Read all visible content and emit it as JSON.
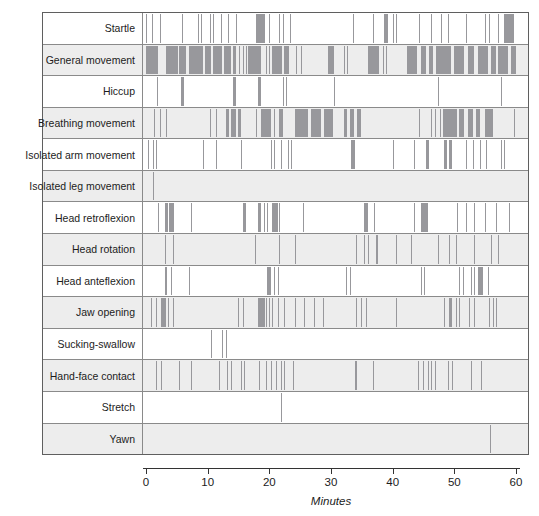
{
  "chart_data": {
    "type": "scatter",
    "subtype": "event-raster-timeline",
    "title": "",
    "xlabel": "Minutes",
    "xlim": [
      0,
      60
    ],
    "xticks": [
      0,
      10,
      20,
      30,
      40,
      50,
      60
    ],
    "grid": false,
    "legend": "none",
    "event_format": "[start_minute, duration_minutes]",
    "categories": [
      "Startle",
      "General movement",
      "Hiccup",
      "Breathing movement",
      "Isolated arm movement",
      "Isolated leg movement",
      "Head retroflexion",
      "Head rotation",
      "Head anteflexion",
      "Jaw opening",
      "Sucking-swallow",
      "Hand-face contact",
      "Stretch",
      "Yawn"
    ],
    "rows": [
      {
        "label": "Startle",
        "events": [
          [
            0,
            0.2
          ],
          [
            1,
            0.2
          ],
          [
            2.3,
            0.2
          ],
          [
            5.8,
            0.2
          ],
          [
            8.5,
            0.2
          ],
          [
            8.9,
            0.2
          ],
          [
            10.3,
            0.2
          ],
          [
            10.8,
            0.2
          ],
          [
            12.2,
            0.2
          ],
          [
            13.3,
            0.2
          ],
          [
            14.6,
            0.2
          ],
          [
            17.8,
            1.4
          ],
          [
            20,
            0.2
          ],
          [
            21.6,
            0.2
          ],
          [
            22.2,
            0.2
          ],
          [
            23.4,
            0.2
          ],
          [
            33.5,
            0.2
          ],
          [
            36.8,
            0.2
          ],
          [
            38.6,
            0.7
          ],
          [
            40,
            0.2
          ],
          [
            40.5,
            0.2
          ],
          [
            44.3,
            0.2
          ],
          [
            46.2,
            0.2
          ],
          [
            47.8,
            0.2
          ],
          [
            48.9,
            0.2
          ],
          [
            51.9,
            0.2
          ],
          [
            54.9,
            0.2
          ],
          [
            55.7,
            0.2
          ],
          [
            57,
            0.2
          ],
          [
            58.1,
            1.6
          ]
        ]
      },
      {
        "label": "General movement",
        "events": [
          [
            0,
            1.9
          ],
          [
            3.2,
            1.9
          ],
          [
            5.4,
            1.1
          ],
          [
            7,
            2.2
          ],
          [
            9.5,
            1
          ],
          [
            10.8,
            1.4
          ],
          [
            12.7,
            1.1
          ],
          [
            14.1,
            0.5
          ],
          [
            15.1,
            0.2
          ],
          [
            15.7,
            0.2
          ],
          [
            16.2,
            0.2
          ],
          [
            16.5,
            2.1
          ],
          [
            19.5,
            0.2
          ],
          [
            20,
            0.2
          ],
          [
            20.5,
            1.7
          ],
          [
            22.4,
            0.8
          ],
          [
            24.3,
            0.2
          ],
          [
            25.1,
            0.2
          ],
          [
            29.5,
            1
          ],
          [
            32.1,
            0.2
          ],
          [
            32.6,
            0.2
          ],
          [
            36,
            1.8
          ],
          [
            38.4,
            0.2
          ],
          [
            38.9,
            0.2
          ],
          [
            42.4,
            1.7
          ],
          [
            44.6,
            0.8
          ],
          [
            45.9,
            0.6
          ],
          [
            47,
            2.5
          ],
          [
            50,
            1.6
          ],
          [
            52.2,
            1
          ],
          [
            53.8,
            1.6
          ],
          [
            56,
            0.8
          ],
          [
            57,
            1.6
          ],
          [
            59.2,
            0.8
          ]
        ]
      },
      {
        "label": "Hiccup",
        "events": [
          [
            1.8,
            0.2
          ],
          [
            5.7,
            0.5
          ],
          [
            14.1,
            0.5
          ],
          [
            18.1,
            0.5
          ],
          [
            22.2,
            0.2
          ],
          [
            22.7,
            0.2
          ],
          [
            30.5,
            0.2
          ],
          [
            47.3,
            0.2
          ],
          [
            57.6,
            0.2
          ]
        ]
      },
      {
        "label": "Breathing movement",
        "events": [
          [
            1.3,
            0.2
          ],
          [
            2.2,
            0.2
          ],
          [
            3.2,
            0.2
          ],
          [
            10.3,
            0.2
          ],
          [
            11.4,
            0.2
          ],
          [
            13,
            0.5
          ],
          [
            13.8,
            0.8
          ],
          [
            14.9,
            0.5
          ],
          [
            17.8,
            0.2
          ],
          [
            18.6,
            1.7
          ],
          [
            20.8,
            0.2
          ],
          [
            21.6,
            0.6
          ],
          [
            24.1,
            2.1
          ],
          [
            26.8,
            1.6
          ],
          [
            28.9,
            1.4
          ],
          [
            32.1,
            0.5
          ],
          [
            33.1,
            0.6
          ],
          [
            34.2,
            0.6
          ],
          [
            44.3,
            0.2
          ],
          [
            46.2,
            0.2
          ],
          [
            46.8,
            0.2
          ],
          [
            47.6,
            0.2
          ],
          [
            48.1,
            2.2
          ],
          [
            50.8,
            0.8
          ],
          [
            52.2,
            0.8
          ],
          [
            53.5,
            0.6
          ],
          [
            54.9,
            1.3
          ],
          [
            59.7,
            0.2
          ]
        ]
      },
      {
        "label": "Isolated arm movement",
        "events": [
          [
            0.3,
            0.2
          ],
          [
            1.1,
            0.2
          ],
          [
            1.6,
            0.2
          ],
          [
            9.2,
            0.2
          ],
          [
            11.4,
            0.2
          ],
          [
            15.4,
            0.2
          ],
          [
            20.3,
            0.2
          ],
          [
            20.8,
            0.2
          ],
          [
            21.9,
            0.2
          ],
          [
            23,
            0.2
          ],
          [
            23.5,
            0.2
          ],
          [
            33.2,
            0.6
          ],
          [
            40,
            0.2
          ],
          [
            43.5,
            0.2
          ],
          [
            45.4,
            0.5
          ],
          [
            48.4,
            0.5
          ],
          [
            49.2,
            0.5
          ],
          [
            51.9,
            0.2
          ],
          [
            53,
            0.2
          ],
          [
            54.1,
            0.2
          ],
          [
            55.1,
            0.2
          ],
          [
            57.6,
            0.2
          ],
          [
            58.1,
            0.2
          ]
        ]
      },
      {
        "label": "Isolated leg movement",
        "events": [
          [
            1.2,
            0.2
          ]
        ]
      },
      {
        "label": "Head retroflexion",
        "events": [
          [
            1.9,
            0.2
          ],
          [
            3,
            0.5
          ],
          [
            3.8,
            0.8
          ],
          [
            7.3,
            0.2
          ],
          [
            15.7,
            0.5
          ],
          [
            18.1,
            0.5
          ],
          [
            19.2,
            0.2
          ],
          [
            19.7,
            0.2
          ],
          [
            20.5,
            0.9
          ],
          [
            21.6,
            0.2
          ],
          [
            25.4,
            0.2
          ],
          [
            35.4,
            0.6
          ],
          [
            37,
            0.2
          ],
          [
            43.5,
            0.2
          ],
          [
            44.6,
            1.1
          ],
          [
            50.5,
            0.2
          ],
          [
            51.9,
            0.2
          ],
          [
            53.2,
            0.2
          ],
          [
            54.9,
            0.2
          ],
          [
            56.8,
            0.2
          ],
          [
            58.9,
            0.2
          ]
        ]
      },
      {
        "label": "Head rotation",
        "events": [
          [
            3,
            0.2
          ],
          [
            4.3,
            0.2
          ],
          [
            17.6,
            0.2
          ],
          [
            21.6,
            0.2
          ],
          [
            24.1,
            0.2
          ],
          [
            34.1,
            0.2
          ],
          [
            35.4,
            0.2
          ],
          [
            36,
            0.2
          ],
          [
            37.3,
            0.4
          ],
          [
            40.5,
            0.2
          ],
          [
            43,
            0.2
          ],
          [
            47.3,
            0.2
          ],
          [
            49.2,
            0.2
          ],
          [
            50.3,
            0.2
          ],
          [
            53.2,
            0.2
          ],
          [
            56,
            0.2
          ],
          [
            57,
            0.2
          ]
        ]
      },
      {
        "label": "Head anteflexion",
        "events": [
          [
            3,
            0.4
          ],
          [
            4.1,
            0.2
          ],
          [
            7,
            0.2
          ],
          [
            19.7,
            0.6
          ],
          [
            20.8,
            0.2
          ],
          [
            21.4,
            0.2
          ],
          [
            32.4,
            0.2
          ],
          [
            33,
            0.2
          ],
          [
            44.6,
            0.2
          ],
          [
            45.1,
            0.2
          ],
          [
            50.8,
            0.2
          ],
          [
            51.4,
            0.2
          ],
          [
            52.7,
            0.2
          ],
          [
            53.2,
            0.2
          ],
          [
            53.8,
            0.8
          ],
          [
            55.4,
            0.2
          ]
        ]
      },
      {
        "label": "Jaw opening",
        "events": [
          [
            0.8,
            0.2
          ],
          [
            1.6,
            0.2
          ],
          [
            2.4,
            0.8
          ],
          [
            3.5,
            0.2
          ],
          [
            4.3,
            0.2
          ],
          [
            14.9,
            0.2
          ],
          [
            15.7,
            0.2
          ],
          [
            18.1,
            1.1
          ],
          [
            19.5,
            0.2
          ],
          [
            20,
            0.2
          ],
          [
            20.5,
            0.2
          ],
          [
            21.4,
            0.2
          ],
          [
            22.4,
            0.2
          ],
          [
            24.1,
            0.2
          ],
          [
            25.7,
            0.2
          ],
          [
            27.3,
            0.2
          ],
          [
            28.7,
            0.2
          ],
          [
            34.1,
            0.2
          ],
          [
            34.9,
            0.2
          ],
          [
            35.7,
            0.2
          ],
          [
            40.5,
            0.2
          ],
          [
            48.4,
            0.2
          ],
          [
            49.2,
            0.5
          ],
          [
            50.3,
            0.2
          ],
          [
            50.8,
            0.2
          ],
          [
            52.4,
            0.2
          ],
          [
            53.2,
            0.2
          ],
          [
            55.7,
            0.2
          ],
          [
            56.2,
            0.2
          ],
          [
            56.8,
            0.2
          ]
        ]
      },
      {
        "label": "Sucking-swallow",
        "events": [
          [
            10.6,
            0.2
          ],
          [
            12.4,
            0.2
          ],
          [
            13,
            0.2
          ]
        ]
      },
      {
        "label": "Hand-face contact",
        "events": [
          [
            1.6,
            0.2
          ],
          [
            2.4,
            0.2
          ],
          [
            5.4,
            0.2
          ],
          [
            7.3,
            0.2
          ],
          [
            11.9,
            0.2
          ],
          [
            13.2,
            0.2
          ],
          [
            13.8,
            0.2
          ],
          [
            15.4,
            0.2
          ],
          [
            15.9,
            0.2
          ],
          [
            18.4,
            0.2
          ],
          [
            19.5,
            0.2
          ],
          [
            20.3,
            0.2
          ],
          [
            21.1,
            0.2
          ],
          [
            21.9,
            0.2
          ],
          [
            22.4,
            0.2
          ],
          [
            23.8,
            0.2
          ],
          [
            33.9,
            0.4
          ],
          [
            36.8,
            0.2
          ],
          [
            44.1,
            0.2
          ],
          [
            44.9,
            0.2
          ],
          [
            45.7,
            0.2
          ],
          [
            46.2,
            0.2
          ],
          [
            46.8,
            0.2
          ],
          [
            48.9,
            0.2
          ],
          [
            49.7,
            0.2
          ],
          [
            52.7,
            0.2
          ],
          [
            54.3,
            0.2
          ]
        ]
      },
      {
        "label": "Stretch",
        "events": [
          [
            21.9,
            0.2
          ]
        ]
      },
      {
        "label": "Yawn",
        "events": [
          [
            55.8,
            0.2
          ]
        ]
      }
    ],
    "colors": {
      "event_mark": "#98989c",
      "row_alt_background": "#ededed",
      "row_background": "#ffffff",
      "border": "#5f5f5f",
      "inner_line": "#8a8a8a",
      "axis": "#333333"
    }
  }
}
